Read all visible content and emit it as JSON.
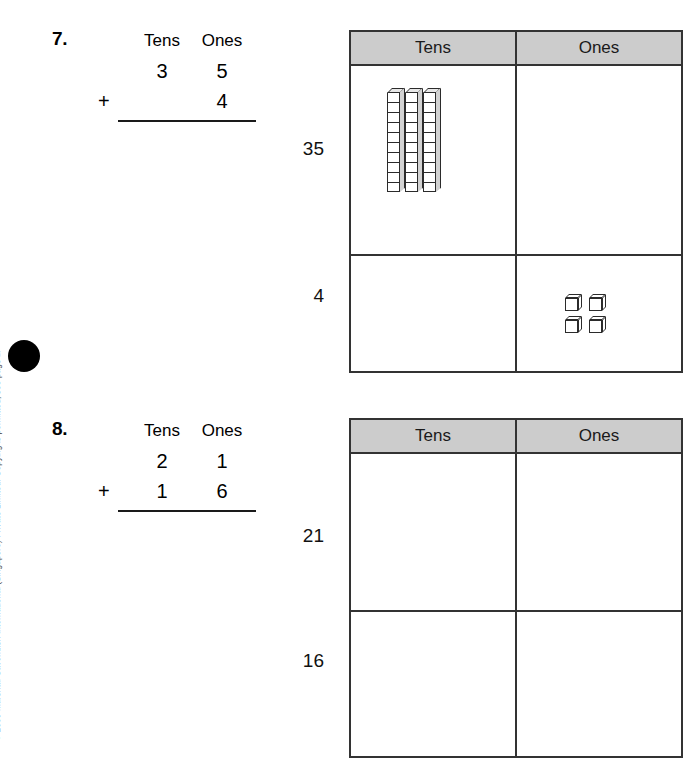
{
  "page": {
    "copyright": "© 2009 Marshall Cavendish International (Singapore) Private Limited. Copying is permitted; see page ii.",
    "marker": "page-bullet"
  },
  "problems": [
    {
      "number": "7.",
      "sum": {
        "header_tens": "Tens",
        "header_ones": "Ones",
        "addend1_tens": "3",
        "addend1_ones": "5",
        "plus": "+",
        "addend2_tens": "",
        "addend2_ones": "4"
      },
      "table": {
        "header_tens": "Tens",
        "header_ones": "Ones",
        "rows": [
          {
            "label": "35",
            "tens_blocks": 3,
            "ones_blocks": 0
          },
          {
            "label": "4",
            "tens_blocks": 0,
            "ones_blocks": 4
          }
        ]
      }
    },
    {
      "number": "8.",
      "sum": {
        "header_tens": "Tens",
        "header_ones": "Ones",
        "addend1_tens": "2",
        "addend1_ones": "1",
        "plus": "+",
        "addend2_tens": "1",
        "addend2_ones": "6"
      },
      "table": {
        "header_tens": "Tens",
        "header_ones": "Ones",
        "rows": [
          {
            "label": "21",
            "tens_blocks": 0,
            "ones_blocks": 0
          },
          {
            "label": "16",
            "tens_blocks": 0,
            "ones_blocks": 0
          }
        ]
      }
    }
  ],
  "style": {
    "header_fill": "#cccccc",
    "border_color": "#333333",
    "text_color": "#000000"
  }
}
